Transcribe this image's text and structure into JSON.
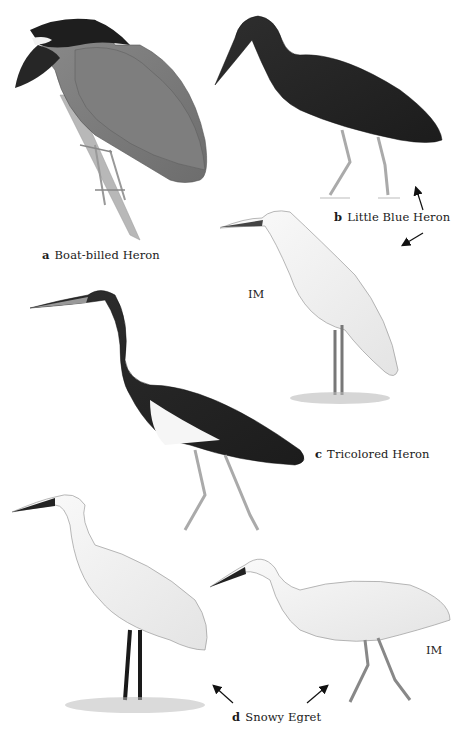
{
  "plate": {
    "birds": [
      {
        "letter": "a",
        "name": "Boat-billed Heron"
      },
      {
        "letter": "b",
        "name": "Little Blue Heron"
      },
      {
        "letter": "c",
        "name": "Tricolored Heron"
      },
      {
        "letter": "d",
        "name": "Snowy Egret"
      }
    ],
    "age_labels": [
      "IM",
      "IM"
    ]
  }
}
